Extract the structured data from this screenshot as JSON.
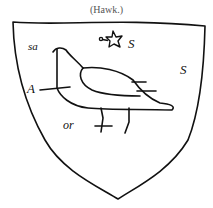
{
  "caption": "(Hawk.)",
  "shield": {
    "stroke_color": "#111111",
    "background": "#ffffff"
  },
  "annotations": {
    "top_left": "sa",
    "star_right": "S",
    "right_field": "S",
    "left_line": "A",
    "legs": "or"
  },
  "charges": [
    "hawk-icon",
    "mullet-star-icon"
  ]
}
